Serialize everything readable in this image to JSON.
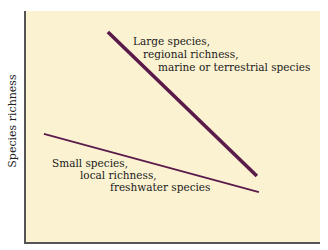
{
  "chart_data": {
    "type": "line",
    "title": "",
    "xlabel": "",
    "ylabel": "Species richness",
    "grid": false,
    "axis_ticks": "none",
    "coordinate_space": "normalized 0-100 (x left-to-right, y bottom-to-top)",
    "colors": {
      "background": "#fbf2d2",
      "line": "#5a1a4a",
      "axis": "#555555"
    },
    "series": [
      {
        "name": "Large species, regional richness, marine or terrestrial species",
        "style": "thick",
        "points": [
          {
            "x": 28.1,
            "y": 90.9
          },
          {
            "x": 78.6,
            "y": 28.6
          }
        ]
      },
      {
        "name": "Small species, local richness, freshwater species",
        "style": "thin",
        "points": [
          {
            "x": 6.4,
            "y": 46.8
          },
          {
            "x": 79.3,
            "y": 21.6
          }
        ]
      }
    ],
    "annotations": [
      {
        "lines": [
          "Large species,",
          "regional richness,",
          "marine or terrestrial species"
        ],
        "position": "upper right of thick line"
      },
      {
        "lines": [
          "Small species,",
          "local richness,",
          "freshwater species"
        ],
        "position": "below thin line"
      }
    ]
  },
  "axis": {
    "y_label": "Species richness"
  },
  "annotations": {
    "large": {
      "line1": "Large species,",
      "line2": "regional richness,",
      "line3": "marine or terrestrial species"
    },
    "small": {
      "line1": "Small species,",
      "line2": "local richness,",
      "line3": "freshwater species"
    }
  }
}
